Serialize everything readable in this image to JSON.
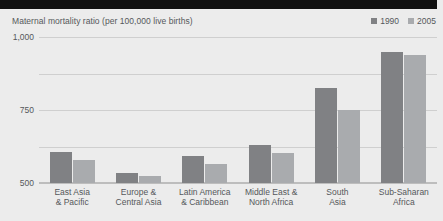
{
  "chart_data": {
    "type": "bar",
    "title": "Maternal mortality ratio (per 100,000 live births)",
    "xlabel": "",
    "ylabel": "",
    "ylim": [
      0,
      1000
    ],
    "yticks": [
      "0",
      "250",
      "500",
      "750",
      "1,000"
    ],
    "ytick_values": [
      0,
      250,
      500,
      750,
      1000
    ],
    "grid": true,
    "legend_position": "top-right",
    "categories": [
      "East Asia & Pacific",
      "Europe & Central Asia",
      "Latin America & Caribbean",
      "Middle East & North Africa",
      "South Asia",
      "Sub-Saharan Africa"
    ],
    "category_lines": [
      [
        "East Asia",
        "& Pacific"
      ],
      [
        "Europe &",
        "Central Asia"
      ],
      [
        "Latin America",
        "& Caribbean"
      ],
      [
        "Middle East &",
        "North Africa"
      ],
      [
        "South",
        "Asia"
      ],
      [
        "Sub-Saharan",
        "Africa"
      ]
    ],
    "series": [
      {
        "name": "1990",
        "color": "#808184",
        "values": [
          215,
          70,
          185,
          260,
          650,
          900
        ]
      },
      {
        "name": "2005",
        "color": "#a9abae",
        "values": [
          155,
          45,
          130,
          205,
          500,
          880
        ]
      }
    ]
  },
  "colors": {
    "background": "#ececec",
    "top_rule": "#111111",
    "text": "#55585b",
    "gridline": "#cfcfcf",
    "series_1990": "#808184",
    "series_2005": "#a9abae"
  }
}
